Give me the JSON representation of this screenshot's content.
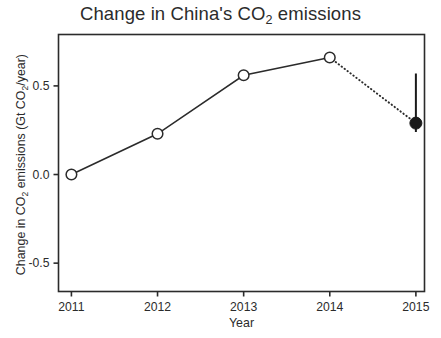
{
  "chart_data": {
    "type": "line",
    "title": "Change in China's CO2 emissions",
    "title_parts": {
      "before": "Change in China's CO",
      "sub": "2",
      "after": " emissions"
    },
    "xlabel": "Year",
    "ylabel": "Change in CO2 emissions (Gt CO2/year)",
    "ylabel_parts": {
      "a": "Change in CO",
      "sub1": "2",
      "b": " emissions (Gt CO",
      "sub2": "2",
      "c": "/year)"
    },
    "x": [
      2011,
      2012,
      2013,
      2014,
      2015
    ],
    "categories": [
      "2011",
      "2012",
      "2013",
      "2014",
      "2015"
    ],
    "values": [
      0.0,
      0.23,
      0.56,
      0.66,
      0.29
    ],
    "series": [
      {
        "name": "Observed change",
        "style": "solid",
        "marker": "open-circle",
        "x": [
          2011,
          2012,
          2013,
          2014
        ],
        "values": [
          0.0,
          0.23,
          0.56,
          0.66
        ]
      },
      {
        "name": "Projected 2015",
        "style": "dotted",
        "marker": "filled-circle",
        "x": [
          2014,
          2015
        ],
        "values": [
          0.66,
          0.29
        ],
        "errorbar": {
          "x": 2015,
          "value": 0.29,
          "low": 0.24,
          "high": 0.57
        }
      }
    ],
    "xticks": [
      "2011",
      "2012",
      "2013",
      "2014",
      "2015"
    ],
    "yticks": [
      "0.5",
      "0.0",
      "-0.5"
    ],
    "ytick_values": [
      0.5,
      0.0,
      -0.5
    ],
    "xlim": [
      2010.85,
      2015.1
    ],
    "ylim": [
      -0.66,
      0.79
    ],
    "grid": false,
    "legend": "none",
    "colors": {
      "line": "#2b2b2b",
      "marker_face": "#ffffff",
      "marker_edge": "#2b2b2b",
      "projected_marker": "#1a1a1a",
      "frame": "#2b2b2b"
    }
  }
}
